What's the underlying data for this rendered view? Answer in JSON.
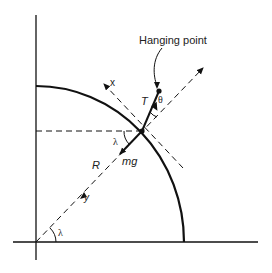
{
  "diagram": {
    "labels": {
      "hanging_point": "Hanging point",
      "x_axis": "x",
      "y_axis": "y",
      "tension": "T",
      "theta": "θ",
      "lambda_top": "λ",
      "lambda_bottom": "λ",
      "weight": "mg",
      "radius": "R"
    },
    "colors": {
      "stroke": "#111111",
      "background": "#ffffff"
    }
  }
}
